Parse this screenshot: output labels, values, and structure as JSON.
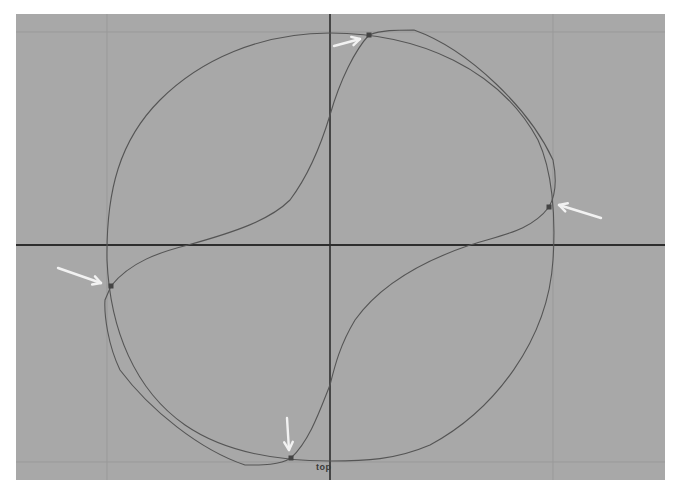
{
  "viewport": {
    "name": "top",
    "background": "#a8a8a8",
    "grid_color": "#999999",
    "axis_color": "#2e2e2e",
    "curve_color": "#555555",
    "marker_color": "#444444",
    "arrow_color": "#f2f2f2"
  },
  "view_label": "top",
  "grid_lines": {
    "vertical_x": [
      107,
      553
    ],
    "horizontal_y": [
      32,
      462
    ]
  },
  "axes": {
    "origin_x": 330,
    "origin_y": 245
  },
  "curves": {
    "circle": "M330,33 C420,33 500,70 538,140 C552,170 556,215 553,260 C548,340 495,410 430,445 C395,460 365,461 330,461 C290,461 230,456 185,425 C135,390 110,330 107,260 C106,190 120,140 160,100 C200,60 260,33 330,33 Z",
    "s_curve": "M369,35 C382,30 395,30 414,30 C470,50 530,110 553,160 C557,180 556,195 549,207 C530,232 500,235 470,245 C420,262 380,285 355,320 C340,345 335,365 330,385 C320,410 310,440 291,458 C278,466 258,465 245,465 C200,450 150,410 120,370 C108,345 104,315 105,300 L111,286 C130,262 160,252 188,245 C235,232 270,220 290,200 C305,180 318,155 330,115 C340,80 355,50 369,35 Z"
  },
  "control_points": [
    {
      "id": "top",
      "x": 369,
      "y": 35
    },
    {
      "id": "right",
      "x": 549,
      "y": 207
    },
    {
      "id": "left",
      "x": 111,
      "y": 286
    },
    {
      "id": "bottom",
      "x": 291,
      "y": 458
    }
  ],
  "arrows": [
    {
      "id": "arrow-top",
      "x1": 334,
      "y1": 46,
      "x2": 360,
      "y2": 39
    },
    {
      "id": "arrow-right",
      "x1": 601,
      "y1": 218,
      "x2": 559,
      "y2": 205
    },
    {
      "id": "arrow-left",
      "x1": 58,
      "y1": 268,
      "x2": 101,
      "y2": 283
    },
    {
      "id": "arrow-bottom",
      "x1": 287,
      "y1": 418,
      "x2": 289,
      "y2": 450
    }
  ]
}
